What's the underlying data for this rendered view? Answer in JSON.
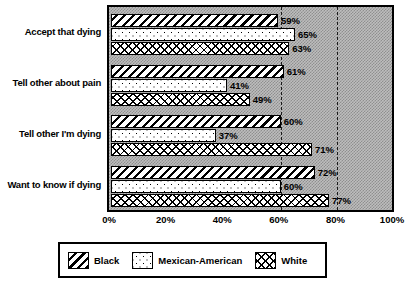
{
  "chart_data": {
    "type": "bar",
    "orientation": "horizontal",
    "title": "",
    "xlabel": "",
    "ylabel": "",
    "xlim": [
      0,
      100
    ],
    "xticks": [
      "0%",
      "20%",
      "40%",
      "60%",
      "80%",
      "100%"
    ],
    "xtick_values": [
      0,
      20,
      40,
      60,
      80,
      100
    ],
    "gridlines": [
      60,
      80
    ],
    "grid": "dashed-vertical",
    "legend_position": "bottom",
    "categories": [
      "Accept that dying",
      "Tell other about pain",
      "Tell other I'm dying",
      "Want to know if dying"
    ],
    "series": [
      {
        "name": "Black",
        "pattern": "diagonal-stripes",
        "values": [
          59,
          61,
          60,
          72
        ],
        "labels": [
          "59%",
          "61%",
          "60%",
          "72%"
        ]
      },
      {
        "name": "Mexican-American",
        "pattern": "dots",
        "values": [
          65,
          41,
          37,
          60
        ],
        "labels": [
          "65%",
          "41%",
          "37%",
          "60%"
        ]
      },
      {
        "name": "White",
        "pattern": "cross-hatch",
        "values": [
          63,
          49,
          71,
          77
        ],
        "labels": [
          "63%",
          "49%",
          "71%",
          "77%"
        ]
      }
    ]
  },
  "legend": {
    "items": [
      {
        "label": "Black",
        "pattern": "diagonal-stripes"
      },
      {
        "label": "Mexican-American",
        "pattern": "dots"
      },
      {
        "label": "White",
        "pattern": "cross-hatch"
      }
    ]
  },
  "colors": {
    "plot_background": "#bdbdbd",
    "ink": "#000000",
    "bar_fill": "#ffffff"
  }
}
